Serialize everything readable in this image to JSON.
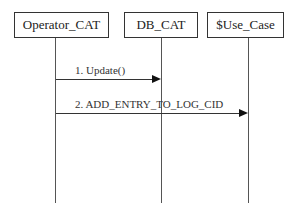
{
  "diagram": {
    "type": "sequence",
    "participants": [
      {
        "id": "p1",
        "label": "Operator_CAT"
      },
      {
        "id": "p2",
        "label": "DB_CAT"
      },
      {
        "id": "p3",
        "label": "$Use_Case"
      }
    ],
    "messages": [
      {
        "from": "Operator_CAT",
        "to": "DB_CAT",
        "label": "1. Update()"
      },
      {
        "from": "Operator_CAT",
        "to": "$Use_Case",
        "label": "2. ADD_ENTRY_TO_LOG_CID"
      }
    ]
  }
}
